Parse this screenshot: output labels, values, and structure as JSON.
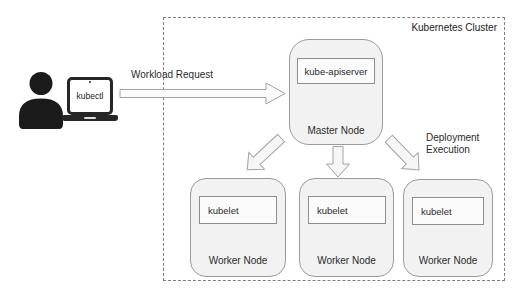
{
  "cluster": {
    "label": "Kubernetes Cluster"
  },
  "client": {
    "laptop_label": "kubectl"
  },
  "labels": {
    "workload_request": "Workload Request",
    "deployment_line1": "Deployment",
    "deployment_line2": "Execution"
  },
  "master_node": {
    "component": "kube-apiserver",
    "label": "Master Node"
  },
  "worker_nodes": [
    {
      "component": "kubelet",
      "label": "Worker Node"
    },
    {
      "component": "kubelet",
      "label": "Worker Node"
    },
    {
      "component": "kubelet",
      "label": "Worker Node"
    }
  ],
  "colors": {
    "node_fill": "#f2f2f2",
    "node_border": "#9a9a9a",
    "inner_box_fill": "#fbfbfb",
    "inner_box_border": "#8d8d8d",
    "arrow_fill": "#f6f6f6",
    "arrow_stroke": "#a3a3a3",
    "cluster_border_color": "#7f7f7f",
    "text": "#2b2b2b",
    "icon": "#1b1b1b"
  }
}
